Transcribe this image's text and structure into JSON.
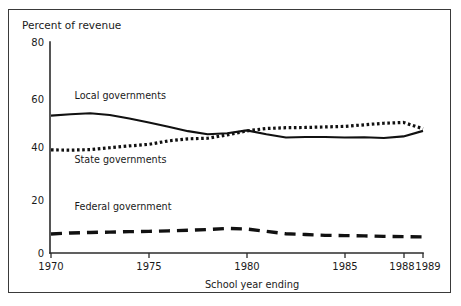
{
  "figure": {
    "frame_border_color": "#3a3a3a",
    "background": "#ffffff"
  },
  "chart_data": {
    "type": "line",
    "title": "",
    "ylabel": "Percent of revenue",
    "xlabel": "School year ending",
    "ylim": [
      0,
      80
    ],
    "xlim": [
      1970,
      1989
    ],
    "yticks": [
      0,
      20,
      40,
      60,
      80
    ],
    "ytick_labels": [
      "0",
      "20",
      "40",
      "60",
      "80"
    ],
    "xticks": [
      1970,
      1975,
      1980,
      1985,
      1988,
      1989
    ],
    "xtick_labels": [
      "1970",
      "1975",
      "1980",
      "1985",
      "1988",
      "1989"
    ],
    "grid": false,
    "legend_position": "inline-annotations",
    "x": [
      1970,
      1971,
      1972,
      1973,
      1974,
      1975,
      1976,
      1977,
      1978,
      1979,
      1980,
      1981,
      1982,
      1983,
      1984,
      1985,
      1986,
      1987,
      1988,
      1989
    ],
    "series": [
      {
        "name": "Local governments",
        "style": "solid",
        "label_x": 1971.2,
        "label_y": 58.5,
        "values": [
          52.1,
          52.6,
          53.0,
          52.3,
          51.0,
          49.5,
          47.9,
          46.2,
          45.0,
          45.4,
          46.5,
          45.0,
          43.8,
          44.0,
          44.0,
          43.8,
          43.9,
          43.6,
          44.2,
          46.3
        ]
      },
      {
        "name": "State governments",
        "style": "dotted",
        "label_x": 1971.2,
        "label_y": 34.0,
        "values": [
          39.1,
          39.0,
          39.2,
          39.9,
          40.6,
          41.2,
          42.5,
          43.3,
          43.5,
          44.8,
          46.3,
          47.2,
          47.5,
          47.6,
          47.8,
          48.0,
          48.6,
          49.2,
          49.5,
          47.1
        ]
      },
      {
        "name": "Federal government",
        "style": "dashed",
        "label_x": 1971.2,
        "label_y": 16.2,
        "values": [
          7.2,
          7.6,
          7.8,
          7.9,
          8.1,
          8.2,
          8.4,
          8.6,
          8.9,
          9.3,
          9.1,
          8.2,
          7.3,
          7.0,
          6.7,
          6.6,
          6.5,
          6.3,
          6.2,
          6.1
        ]
      }
    ]
  }
}
